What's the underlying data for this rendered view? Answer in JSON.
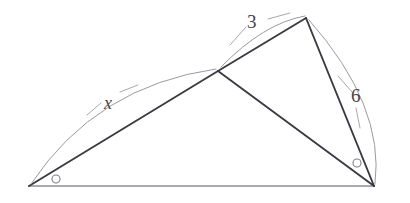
{
  "diagram": {
    "canvas": {
      "width": 410,
      "height": 203
    },
    "background_color": "#ffffff",
    "stroke_color_main": "#3a3a42",
    "stroke_color_light": "#9a9aa2",
    "vertices": [
      {
        "name": "left-vertex",
        "x": 29,
        "y": 186
      },
      {
        "name": "middle-vertex",
        "x": 218,
        "y": 71
      },
      {
        "name": "apex-vertex",
        "x": 306,
        "y": 18
      },
      {
        "name": "right-vertex",
        "x": 374,
        "y": 186
      }
    ],
    "segments": [
      {
        "name": "segment-left-to-middle",
        "from": "left-vertex",
        "to": "middle-vertex",
        "style": "main"
      },
      {
        "name": "segment-middle-to-apex",
        "from": "middle-vertex",
        "to": "apex-vertex",
        "style": "main"
      },
      {
        "name": "segment-middle-to-right",
        "from": "middle-vertex",
        "to": "right-vertex",
        "style": "main"
      },
      {
        "name": "segment-apex-to-right",
        "from": "apex-vertex",
        "to": "right-vertex",
        "style": "main"
      },
      {
        "name": "segment-base",
        "from": "left-vertex",
        "to": "right-vertex",
        "style": "base"
      }
    ],
    "labels": {
      "x": {
        "text": "x",
        "x": 104,
        "y": 94,
        "style": "italic"
      },
      "three": {
        "text": "3",
        "x": 247,
        "y": 12,
        "style": "upright"
      },
      "six": {
        "text": "6",
        "x": 351,
        "y": 86,
        "style": "upright"
      }
    },
    "angle_markers": [
      {
        "name": "angle-marker-left",
        "cx": 56,
        "cy": 179,
        "r": 4
      },
      {
        "name": "angle-marker-right",
        "cx": 357,
        "cy": 163,
        "r": 4
      }
    ],
    "arcs": [
      {
        "name": "arc-x",
        "path": "M 31 184 Q 96 86 216 69"
      },
      {
        "name": "arc-three",
        "path": "M 221 67 Q 264 23 305 16"
      },
      {
        "name": "arc-six",
        "path": "M 309 20 Q 385 106 375 184"
      }
    ],
    "leaders": [
      {
        "name": "leader-x",
        "path": "M 101 103 L 87 115"
      },
      {
        "name": "leader-x-2",
        "path": "M 120 92 L 138 85"
      },
      {
        "name": "leader-three",
        "path": "M 246 27 L 230 45"
      },
      {
        "name": "leader-three-2",
        "path": "M 268 19 L 290 13"
      },
      {
        "name": "leader-six",
        "path": "M 352 92 L 338 76"
      },
      {
        "name": "leader-six-2",
        "path": "M 356 108 L 360 128"
      }
    ]
  }
}
